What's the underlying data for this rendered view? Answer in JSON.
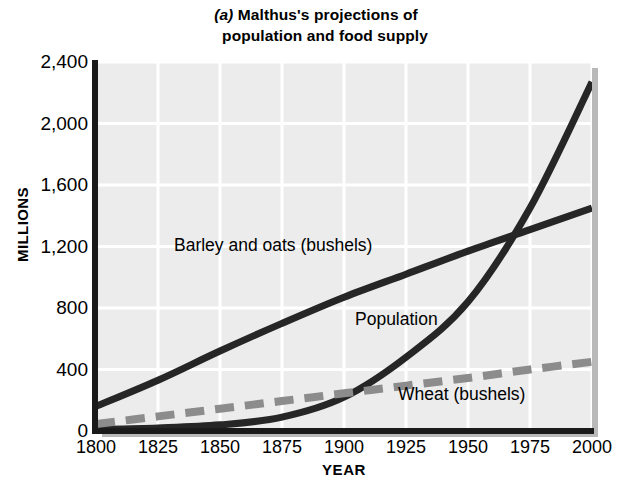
{
  "figure": {
    "panel_letter": "(a)",
    "title_line_1": "Malthus's projections of",
    "title_line_2": "population and food supply"
  },
  "axes": {
    "y_label": "MILLIONS",
    "x_label": "YEAR",
    "y_ticks": [
      "0",
      "400",
      "800",
      "1,200",
      "1,600",
      "2,000",
      "2,400"
    ],
    "x_ticks": [
      "1800",
      "1825",
      "1850",
      "1875",
      "1900",
      "1925",
      "1950",
      "1975",
      "2000"
    ]
  },
  "annotations": {
    "barley": "Barley and oats (bushels)",
    "population": "Population",
    "wheat": "Wheat (bushels)"
  },
  "colors": {
    "plot_background": "#ececec",
    "gridline": "#ffffff",
    "axis": "#1a1a1a",
    "series_solid": "#262626",
    "series_dashed": "#8c8c8c",
    "shadow": "#b9b9b9",
    "page_background": "#ffffff"
  },
  "chart_data": {
    "type": "line",
    "title": "(a) Malthus's projections of population and food supply",
    "xlabel": "YEAR",
    "ylabel": "MILLIONS",
    "xlim": [
      1800,
      2000
    ],
    "ylim": [
      0,
      2400
    ],
    "x_tick_values": [
      1800,
      1825,
      1850,
      1875,
      1900,
      1925,
      1950,
      1975,
      2000
    ],
    "y_tick_values": [
      0,
      400,
      800,
      1200,
      1600,
      2000,
      2400
    ],
    "grid": true,
    "legend": "inline-annotations",
    "x": [
      1800,
      1825,
      1850,
      1875,
      1900,
      1925,
      1950,
      1975,
      2000
    ],
    "series": [
      {
        "name": "Population",
        "style": "solid",
        "color": "#262626",
        "label_text": "Population",
        "values": [
          10,
          20,
          40,
          90,
          220,
          480,
          840,
          1450,
          2270
        ]
      },
      {
        "name": "Barley and oats (bushels)",
        "style": "solid",
        "color": "#262626",
        "label_text": "Barley and oats (bushels)",
        "values": [
          160,
          330,
          520,
          700,
          870,
          1020,
          1170,
          1310,
          1450
        ]
      },
      {
        "name": "Wheat (bushels)",
        "style": "dashed",
        "color": "#8c8c8c",
        "label_text": "Wheat (bushels)",
        "values": [
          45,
          95,
          145,
          195,
          245,
          295,
          345,
          400,
          450
        ]
      }
    ],
    "crossings": [
      {
        "between": [
          "Population",
          "Wheat (bushels)"
        ],
        "approx_year": 1922,
        "approx_value": 430
      },
      {
        "between": [
          "Population",
          "Barley and oats (bushels)"
        ],
        "approx_year": 1982,
        "approx_value": 1330
      }
    ]
  }
}
